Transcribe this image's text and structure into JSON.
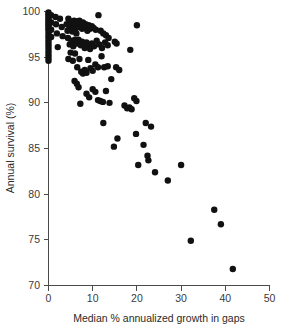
{
  "chart_data": {
    "type": "scatter",
    "title": "",
    "xlabel": "Median % annualized growth in gaps",
    "ylabel": "Annual survival (%)",
    "xlim": [
      0,
      50
    ],
    "ylim": [
      70,
      100
    ],
    "xticks": [
      0,
      10,
      20,
      30,
      40,
      50
    ],
    "yticks": [
      70,
      75,
      80,
      85,
      90,
      95,
      100
    ],
    "xticklabels": [
      "0",
      "10",
      "20",
      "30",
      "40",
      "50"
    ],
    "yticklabels": [
      "70",
      "75",
      "80",
      "85",
      "90",
      "95",
      "100"
    ],
    "grid": false,
    "legend": null,
    "marker": {
      "shape": "circle",
      "color": "#111111",
      "size": 3.2
    },
    "point_count": 136,
    "points": [
      [
        0.0,
        99.9
      ],
      [
        0.0,
        99.7
      ],
      [
        0.0,
        99.5
      ],
      [
        0.0,
        99.3
      ],
      [
        0.0,
        99.1
      ],
      [
        0.0,
        98.9
      ],
      [
        0.0,
        98.7
      ],
      [
        0.0,
        98.5
      ],
      [
        0.0,
        98.3
      ],
      [
        0.0,
        98.1
      ],
      [
        0.0,
        97.9
      ],
      [
        0.0,
        97.6
      ],
      [
        0.0,
        97.3
      ],
      [
        0.0,
        97.0
      ],
      [
        0.0,
        96.7
      ],
      [
        0.0,
        96.4
      ],
      [
        0.0,
        96.1
      ],
      [
        0.0,
        95.8
      ],
      [
        0.0,
        95.5
      ],
      [
        0.0,
        95.2
      ],
      [
        0.0,
        94.9
      ],
      [
        0.0,
        94.6
      ],
      [
        0.6,
        99.6
      ],
      [
        0.6,
        98.8
      ],
      [
        0.6,
        98.0
      ],
      [
        0.6,
        97.2
      ],
      [
        1.6,
        99.4
      ],
      [
        1.7,
        98.6
      ],
      [
        1.9,
        97.6
      ],
      [
        2.1,
        96.1
      ],
      [
        2.6,
        99.2
      ],
      [
        3.0,
        98.3
      ],
      [
        3.2,
        97.3
      ],
      [
        4.1,
        98.6
      ],
      [
        4.3,
        97.9
      ],
      [
        4.5,
        99.2
      ],
      [
        4.7,
        98.1
      ],
      [
        5.0,
        98.9
      ],
      [
        5.2,
        98.4
      ],
      [
        5.4,
        97.8
      ],
      [
        5.6,
        98.7
      ],
      [
        5.8,
        99.0
      ],
      [
        6.0,
        98.5
      ],
      [
        6.2,
        98.2
      ],
      [
        6.3,
        97.6
      ],
      [
        6.5,
        98.9
      ],
      [
        6.7,
        98.6
      ],
      [
        6.9,
        98.3
      ],
      [
        7.0,
        99.0
      ],
      [
        7.2,
        98.7
      ],
      [
        7.4,
        98.4
      ],
      [
        7.6,
        98.1
      ],
      [
        7.8,
        98.8
      ],
      [
        8.0,
        98.5
      ],
      [
        8.2,
        98.2
      ],
      [
        8.4,
        98.6
      ],
      [
        8.6,
        98.3
      ],
      [
        8.8,
        97.9
      ],
      [
        9.1,
        98.5
      ],
      [
        9.4,
        98.1
      ],
      [
        9.8,
        98.4
      ],
      [
        10.2,
        98.2
      ],
      [
        10.7,
        98.0
      ],
      [
        11.3,
        99.6
      ],
      [
        11.8,
        97.9
      ],
      [
        12.4,
        97.6
      ],
      [
        13.0,
        97.4
      ],
      [
        13.6,
        97.1
      ],
      [
        4.4,
        97.1
      ],
      [
        4.8,
        96.4
      ],
      [
        5.2,
        96.8
      ],
      [
        5.6,
        96.2
      ],
      [
        6.0,
        96.9
      ],
      [
        6.4,
        96.5
      ],
      [
        6.8,
        96.9
      ],
      [
        7.0,
        96.6
      ],
      [
        7.3,
        96.3
      ],
      [
        7.6,
        96.7
      ],
      [
        7.9,
        96.4
      ],
      [
        8.2,
        96.0
      ],
      [
        8.6,
        96.6
      ],
      [
        9.0,
        96.3
      ],
      [
        9.4,
        95.9
      ],
      [
        9.8,
        96.5
      ],
      [
        10.3,
        96.2
      ],
      [
        10.9,
        96.8
      ],
      [
        11.5,
        96.4
      ],
      [
        12.1,
        96.0
      ],
      [
        12.8,
        96.6
      ],
      [
        13.4,
        96.3
      ],
      [
        15.0,
        96.7
      ],
      [
        15.4,
        96.5
      ],
      [
        18.5,
        95.8
      ],
      [
        20.0,
        98.5
      ],
      [
        4.5,
        94.8
      ],
      [
        5.0,
        95.5
      ],
      [
        5.5,
        94.6
      ],
      [
        6.0,
        95.4
      ],
      [
        6.5,
        93.9
      ],
      [
        7.0,
        94.8
      ],
      [
        7.4,
        93.4
      ],
      [
        7.8,
        93.2
      ],
      [
        8.2,
        93.6
      ],
      [
        8.6,
        93.3
      ],
      [
        9.0,
        94.7
      ],
      [
        9.5,
        93.8
      ],
      [
        10.0,
        93.5
      ],
      [
        10.6,
        94.2
      ],
      [
        11.2,
        93.9
      ],
      [
        12.0,
        95.1
      ],
      [
        12.6,
        93.9
      ],
      [
        13.4,
        94.0
      ],
      [
        14.2,
        92.6
      ],
      [
        15.3,
        93.9
      ],
      [
        16.0,
        93.6
      ],
      [
        5.9,
        92.4
      ],
      [
        6.4,
        92.1
      ],
      [
        6.8,
        91.7
      ],
      [
        7.2,
        89.9
      ],
      [
        8.6,
        91.0
      ],
      [
        9.2,
        90.6
      ],
      [
        10.0,
        91.5
      ],
      [
        10.6,
        91.2
      ],
      [
        11.2,
        90.3
      ],
      [
        11.7,
        90.2
      ],
      [
        12.3,
        90.1
      ],
      [
        13.0,
        91.3
      ],
      [
        13.8,
        90.0
      ],
      [
        12.4,
        87.8
      ],
      [
        14.8,
        85.2
      ],
      [
        15.6,
        86.1
      ],
      [
        17.2,
        89.7
      ],
      [
        17.8,
        89.4
      ],
      [
        18.3,
        89.5
      ],
      [
        18.8,
        89.3
      ],
      [
        19.4,
        90.5
      ],
      [
        19.9,
        90.2
      ],
      [
        19.8,
        86.6
      ],
      [
        20.3,
        83.2
      ],
      [
        21.5,
        85.4
      ],
      [
        22.0,
        87.8
      ],
      [
        22.4,
        84.2
      ],
      [
        22.6,
        83.7
      ],
      [
        23.2,
        87.4
      ],
      [
        24.1,
        82.4
      ],
      [
        27.0,
        81.5
      ],
      [
        30.0,
        83.2
      ],
      [
        32.2,
        74.9
      ],
      [
        37.5,
        78.3
      ],
      [
        39.0,
        76.7
      ],
      [
        41.7,
        71.8
      ]
    ]
  },
  "axes": {
    "x_title": "Median % annualized growth in gaps",
    "y_title": "Annual survival (%)"
  }
}
